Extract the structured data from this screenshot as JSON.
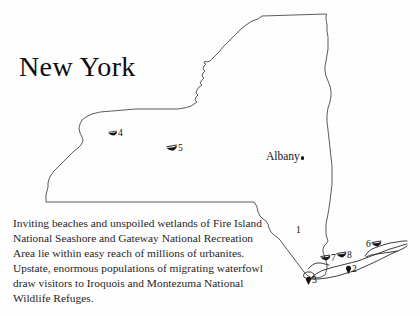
{
  "title": "New York",
  "caption": "Inviting beaches and unspoiled wetlands of Fire Island National Seashore and Gateway National Recreation Area lie within easy reach of millions of urbanites. Upstate, enormous populations of migrating waterfowl draw visitors to Iroquois and Montezuma National Wildlife Refuges.",
  "city": {
    "name": "Albany",
    "marker_icon": "city-dot-icon"
  },
  "colors": {
    "background": "#fefefe",
    "outline": "#4a4a4a",
    "island_outline": "#2b2b2b",
    "text": "#262626",
    "title": "#0d0d0d",
    "marker": "#111111"
  },
  "markers": [
    {
      "id": "1",
      "label": "1",
      "icon": "none",
      "x": 296,
      "y": 228
    },
    {
      "id": "2",
      "label": "2",
      "icon": "dot-icon",
      "x": 349,
      "y": 269
    },
    {
      "id": "3",
      "label": "3",
      "icon": "dot-icon",
      "x": 309,
      "y": 280
    },
    {
      "id": "4",
      "label": "4",
      "icon": "bird-icon",
      "x": 113,
      "y": 131
    },
    {
      "id": "5",
      "label": "5",
      "icon": "bird-icon",
      "x": 174,
      "y": 147
    },
    {
      "id": "6",
      "label": "6",
      "icon": "bird-icon",
      "x": 372,
      "y": 243
    },
    {
      "id": "7",
      "label": "7",
      "icon": "bird-icon",
      "x": 327,
      "y": 258
    },
    {
      "id": "8",
      "label": "8",
      "icon": "bird-icon",
      "x": 343,
      "y": 255
    }
  ]
}
